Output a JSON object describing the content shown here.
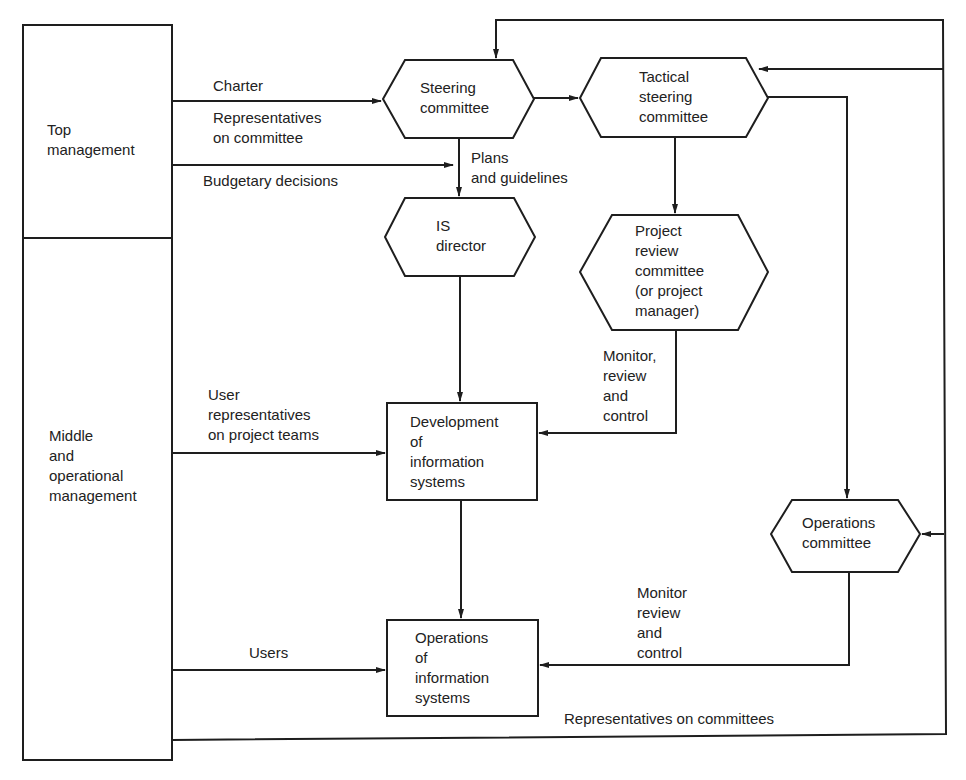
{
  "diagram": {
    "type": "organizational flow diagram",
    "stakeholders": {
      "top": "Top\nmanagement",
      "middle": "Middle\nand\noperational\nmanagement"
    },
    "nodes": {
      "steering": "Steering\ncommittee",
      "tactical": "Tactical\nsteering\ncommittee",
      "is_director": "IS\ndirector",
      "project_review": "Project\nreview\ncommittee\n(or project\nmanager)",
      "development": "Development\nof\ninformation\nsystems",
      "operations_is": "Operations\nof\ninformation\nsystems",
      "operations_committee": "Operations\ncommittee"
    },
    "edge_labels": {
      "charter": "Charter",
      "reps_on_committee": "Representatives\non committee",
      "budgetary": "Budgetary decisions",
      "plans": "Plans\nand guidelines",
      "user_reps": "User\nrepresentatives\non project teams",
      "monitor_project": "Monitor,\nreview\nand\ncontrol",
      "users": "Users",
      "monitor_ops": "Monitor\nreview\nand\ncontrol",
      "reps_on_committees": "Representatives on committees"
    },
    "colors": {
      "line": "#1e1e1e",
      "background": "#ffffff"
    }
  }
}
